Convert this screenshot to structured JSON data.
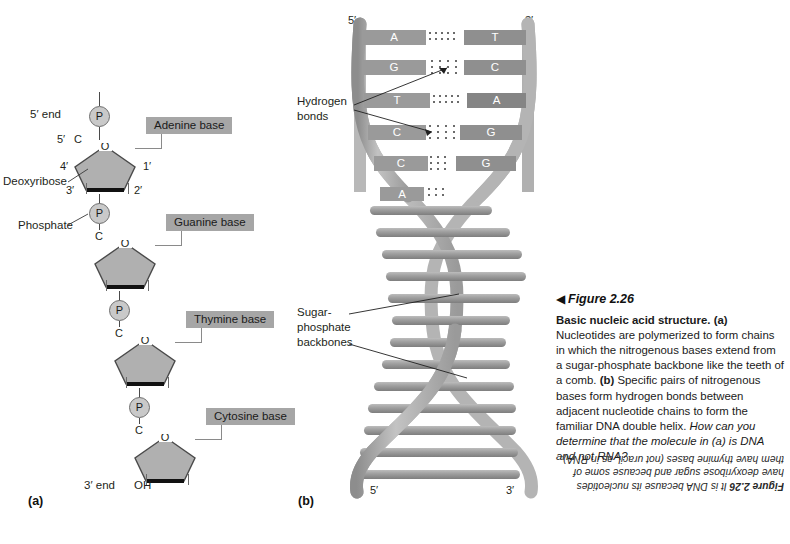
{
  "figure": {
    "marker": "◀",
    "number": "Figure 2.26",
    "title": "Basic nucleic acid structure.",
    "body_a_tag": "(a)",
    "body_a": " Nucleotides are polymerized to form chains in which the nitrogenous bases extend from a sugar-phosphate backbone like the teeth of a comb. ",
    "body_b_tag": "(b)",
    "body_b": " Specific pairs of nitrogenous bases form hydrogen bonds between adjacent nucleotide chains to form the familiar DNA double helix. ",
    "question": "How can you determine that the molecule in (a) is DNA and not RNA?",
    "answer_label": "Figure 2.26",
    "answer_text": "It is DNA because its nucleotides have deoxyribose sugar and because some of them have thymine bases (not uracil, as in RNA)."
  },
  "panels": {
    "a_label": "(a)",
    "b_label": "(b)"
  },
  "panel_a": {
    "end_5": "5′ end",
    "end_3": "3′ end",
    "oh": "OH",
    "deoxyribose_label": "Deoxyribose",
    "phosphate_label": "Phosphate",
    "phosphate_symbol": "P",
    "carbon_symbol": "C",
    "oxygen_symbol": "O",
    "ring_positions": [
      "5′",
      "4′",
      "3′",
      "2′",
      "1′"
    ],
    "bases": [
      {
        "label": "Adenine base"
      },
      {
        "label": "Guanine base"
      },
      {
        "label": "Thymine base"
      },
      {
        "label": "Cytosine base"
      }
    ]
  },
  "panel_b": {
    "top_left_prime": "5′",
    "top_right_prime": "3′",
    "bottom_left_prime": "5′",
    "bottom_right_prime": "3′",
    "hydrogen_label_line1": "Hydrogen",
    "hydrogen_label_line2": "bonds",
    "backbone_label_line1": "Sugar-",
    "backbone_label_line2": "phosphate",
    "backbone_label_line3": "backbones",
    "base_pairs": [
      {
        "left": "A",
        "right": "T",
        "bonds": 2
      },
      {
        "left": "G",
        "right": "C",
        "bonds": 3
      },
      {
        "left": "T",
        "right": "A",
        "bonds": 2
      },
      {
        "left": "C",
        "right": "G",
        "bonds": 3
      },
      {
        "left": "C",
        "right": "G",
        "bonds": 3
      },
      {
        "left": "A",
        "right": "",
        "bonds": 3
      }
    ]
  },
  "colors": {
    "base_box_fill": "#a6a6a6",
    "phosphate_fill": "#c9c9c9",
    "sugar_fill": "#b0b0b0",
    "bp_block_left": "#9a9a9a",
    "bp_block_right": "#8f8f8f",
    "ribbon": "#a8a8a8",
    "text": "#231f20"
  }
}
